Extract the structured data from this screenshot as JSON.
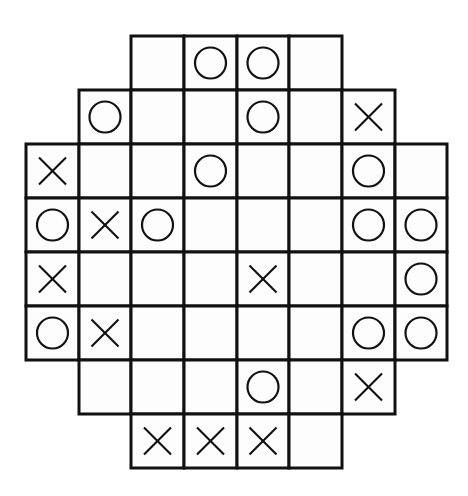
{
  "puzzle": {
    "type": "tic-tac-logic grid",
    "rows": 8,
    "cols": 8,
    "colors": {
      "line": "#111111",
      "mark": "#111111",
      "background": "#ffffff",
      "cell_fill": "#fdfdfd"
    },
    "layout": {
      "col_lines": [
        26,
        79,
        131,
        184,
        237,
        289,
        342,
        395,
        447
      ],
      "row_lines": [
        36,
        90,
        144,
        198,
        252,
        306,
        360,
        414,
        468
      ]
    },
    "grid": [
      [
        null,
        null,
        "",
        "O",
        "O",
        "",
        null,
        null
      ],
      [
        null,
        "O",
        "",
        "",
        "O",
        "",
        "X",
        null
      ],
      [
        "X",
        "",
        "",
        "O",
        "",
        "",
        "O",
        ""
      ],
      [
        "O",
        "X",
        "O",
        "",
        "",
        "",
        "O",
        "O"
      ],
      [
        "X",
        "",
        "",
        "",
        "X",
        "",
        "",
        "O"
      ],
      [
        "O",
        "X",
        "",
        "",
        "",
        "",
        "O",
        "O"
      ],
      [
        null,
        "",
        "",
        "",
        "O",
        "",
        "X",
        null
      ],
      [
        null,
        null,
        "X",
        "X",
        "X",
        "",
        null,
        null
      ]
    ]
  }
}
